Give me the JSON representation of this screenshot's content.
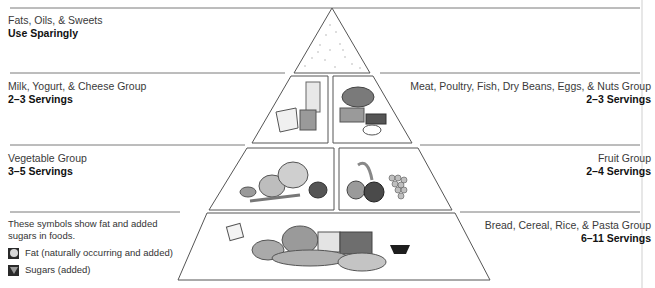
{
  "tiers": {
    "top": {
      "name": "Fats, Oils, & Sweets",
      "servings": "Use Sparingly"
    },
    "milk": {
      "name": "Milk, Yogurt, & Cheese Group",
      "servings": "2–3 Servings"
    },
    "meat": {
      "name": "Meat, Poultry, Fish, Dry Beans, Eggs, & Nuts Group",
      "servings": "2–3 Servings"
    },
    "vegetable": {
      "name": "Vegetable Group",
      "servings": "3–5 Servings"
    },
    "fruit": {
      "name": "Fruit Group",
      "servings": "2–4 Servings"
    },
    "bread": {
      "name": "Bread, Cereal, Rice, & Pasta Group",
      "servings": "6–11 Servings"
    }
  },
  "legend": {
    "intro": "These symbols show fat and added sugars in foods.",
    "items": [
      {
        "icon": "fat-circle-icon",
        "label": "Fat (naturally occurring and added)"
      },
      {
        "icon": "sugar-triangle-icon",
        "label": "Sugars (added)"
      }
    ]
  },
  "colors": {
    "line": "#6e6e6e",
    "text": "#1a1a1a",
    "food_gray": "#8a8a8a",
    "food_dark": "#3a3a3a"
  }
}
